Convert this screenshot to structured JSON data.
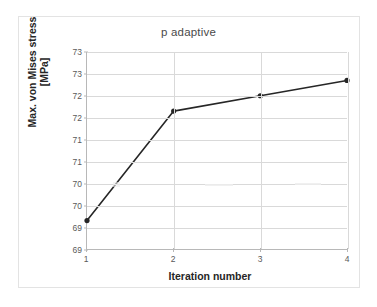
{
  "chart_data": {
    "type": "line",
    "title": "p adaptive",
    "xlabel": "Iteration number",
    "ylabel": "Max. von Mises stress [MPa]",
    "ylabel_line1": "Max. von Mises stress",
    "ylabel_line2": "[MPa]",
    "x": [
      1,
      2,
      3,
      4
    ],
    "values": [
      69.15,
      71.65,
      72.0,
      72.35
    ],
    "xtick_labels": [
      "1",
      "2",
      "3",
      "4"
    ],
    "ytick_labels": [
      "73",
      "73",
      "72",
      "72",
      "71",
      "71",
      "70",
      "70",
      "69",
      "69"
    ],
    "ytick_values": [
      73.0,
      72.5,
      72.0,
      71.5,
      71.0,
      70.5,
      70.0,
      69.5,
      69.0,
      68.5
    ],
    "xlim": [
      1,
      4
    ],
    "ylim": [
      68.5,
      73.0
    ],
    "grid": true,
    "legend": false,
    "marker": "circle",
    "series_color": "#262626",
    "grid_color": "#d9d9d9",
    "axis_color": "#b8b8b8",
    "background": "#ffffff"
  }
}
